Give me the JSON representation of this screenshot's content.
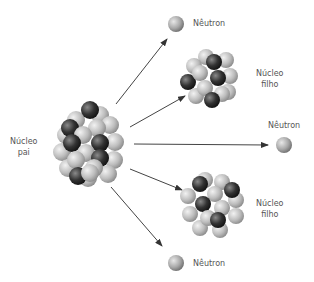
{
  "diagram": {
    "type": "nuclear-fission",
    "labels": {
      "parent_nucleus": [
        "Núcleo",
        "pai"
      ],
      "daughter_nucleus_top": [
        "Núcleo",
        "filho"
      ],
      "daughter_nucleus_bottom": [
        "Núcleo",
        "filho"
      ],
      "neutron_top": "Nêutron",
      "neutron_right": "Nêutron",
      "neutron_bottom": "Nêutron"
    },
    "colors": {
      "light_nucleon": "#c9c9c9",
      "dark_nucleon": "#333333",
      "arrow": "#333333",
      "text": "#555555"
    }
  }
}
